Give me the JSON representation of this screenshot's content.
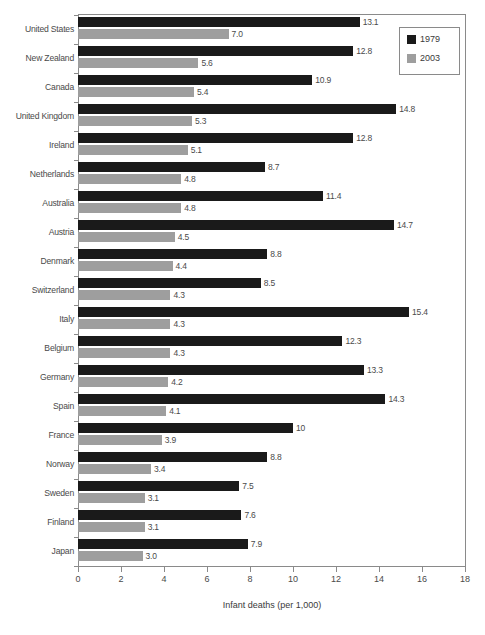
{
  "chart_data": {
    "type": "bar",
    "orientation": "horizontal",
    "title": "",
    "xlabel": "Infant deaths (per 1,000)",
    "ylabel": "",
    "xlim": [
      0,
      18
    ],
    "xticks": [
      0,
      2,
      4,
      6,
      8,
      10,
      12,
      14,
      16,
      18
    ],
    "grid": false,
    "legend_position": "top-right",
    "categories": [
      "United States",
      "New Zealand",
      "Canada",
      "United Kingdom",
      "Ireland",
      "Netherlands",
      "Australia",
      "Austria",
      "Denmark",
      "Switzerland",
      "Italy",
      "Belgium",
      "Germany",
      "Spain",
      "France",
      "Norway",
      "Sweden",
      "Finland",
      "Japan"
    ],
    "series": [
      {
        "name": "1979",
        "color": "#1a1a1a",
        "values": [
          13.1,
          12.8,
          10.9,
          14.8,
          12.8,
          8.7,
          11.4,
          14.7,
          8.8,
          8.5,
          15.4,
          12.3,
          13.3,
          14.3,
          10,
          8.8,
          7.5,
          7.6,
          7.9
        ],
        "labels": [
          "13.1",
          "12.8",
          "10.9",
          "14.8",
          "12.8",
          "8.7",
          "11.4",
          "14.7",
          "8.8",
          "8.5",
          "15.4",
          "12.3",
          "13.3",
          "14.3",
          "10",
          "8.8",
          "7.5",
          "7.6",
          "7.9"
        ]
      },
      {
        "name": "2003",
        "color": "#9e9e9e",
        "values": [
          7.0,
          5.6,
          5.4,
          5.3,
          5.1,
          4.8,
          4.8,
          4.5,
          4.4,
          4.3,
          4.3,
          4.3,
          4.2,
          4.1,
          3.9,
          3.4,
          3.1,
          3.1,
          3.0
        ],
        "labels": [
          "7.0",
          "5.6",
          "5.4",
          "5.3",
          "5.1",
          "4.8",
          "4.8",
          "4.5",
          "4.4",
          "4.3",
          "4.3",
          "4.3",
          "4.2",
          "4.1",
          "3.9",
          "3.4",
          "3.1",
          "3.1",
          "3.0"
        ]
      }
    ]
  },
  "legend": {
    "entries": [
      {
        "label": "1979",
        "color": "#1a1a1a"
      },
      {
        "label": "2003",
        "color": "#9e9e9e"
      }
    ]
  },
  "axis": {
    "x_title": "Infant deaths (per 1,000)",
    "x_tick_labels": [
      "0",
      "2",
      "4",
      "6",
      "8",
      "10",
      "12",
      "14",
      "16",
      "18"
    ]
  }
}
